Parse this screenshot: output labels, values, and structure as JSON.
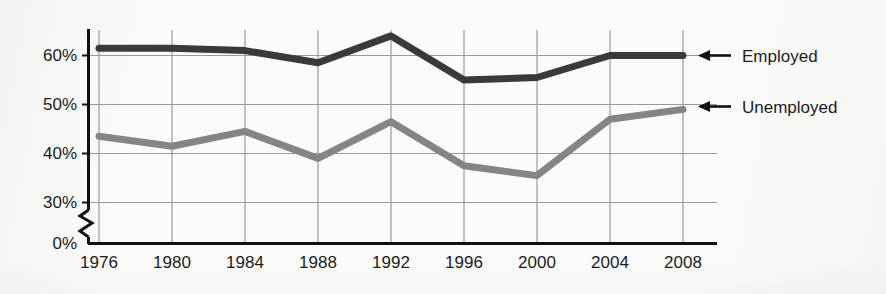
{
  "chart_data": {
    "type": "line",
    "title": "",
    "xlabel": "",
    "ylabel": "",
    "categories": [
      "1976",
      "1980",
      "1984",
      "1988",
      "1992",
      "1996",
      "2000",
      "2004",
      "2008"
    ],
    "x": [
      1976,
      1980,
      1984,
      1988,
      1992,
      1996,
      2000,
      2004,
      2008
    ],
    "series": [
      {
        "name": "Employed",
        "color": "#3a3a3a",
        "values": [
          61.5,
          61.5,
          61,
          58.5,
          64,
          55,
          55.5,
          60,
          60
        ]
      },
      {
        "name": "Unemployed",
        "color": "#858585",
        "values": [
          43.5,
          41.5,
          44.5,
          39,
          46.5,
          37.5,
          35.5,
          47,
          49
        ]
      }
    ],
    "ylim": [
      30,
      65
    ],
    "y_ticks": [
      "0%",
      "30%",
      "40%",
      "50%",
      "60%"
    ],
    "y_tick_values": [
      0,
      30,
      40,
      50,
      60
    ],
    "axis_break": true,
    "axis_break_note": "zigzag break on y-axis between 0% and 30%",
    "grid": true,
    "grid_color": "#9a9a9a",
    "legend_position": "right-inline-arrows",
    "legend": [
      {
        "label": "Employed",
        "arrow": "left-arrow-icon",
        "color": "#3a3a3a"
      },
      {
        "label": "Unemployed",
        "arrow": "left-arrow-icon",
        "color": "#858585"
      }
    ]
  },
  "axis": {
    "y_tick_60": "60%",
    "y_tick_50": "50%",
    "y_tick_40": "40%",
    "y_tick_30": "30%",
    "y_tick_0": "0%",
    "x_tick_0": "1976",
    "x_tick_1": "1980",
    "x_tick_2": "1984",
    "x_tick_3": "1988",
    "x_tick_4": "1992",
    "x_tick_5": "1996",
    "x_tick_6": "2000",
    "x_tick_7": "2004",
    "x_tick_8": "2008"
  },
  "legend_labels": {
    "employed": "Employed",
    "unemployed": "Unemployed"
  },
  "colors": {
    "employed_line": "#3a3a3a",
    "unemployed_line": "#858585",
    "grid": "#9a9a9a",
    "axis": "#111111",
    "background": "#fbfbfa",
    "text": "#1c1c1c"
  }
}
